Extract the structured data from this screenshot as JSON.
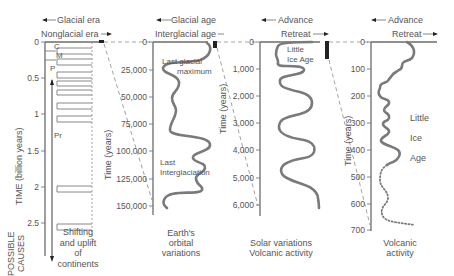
{
  "panels": [
    {
      "id": "era",
      "header_top": "Glacial era",
      "header_bottom": "Nonglacial era",
      "axis_label": "TIME (billion years)",
      "ticks": [
        "0",
        "0.5",
        "1",
        "1.5",
        "2",
        "2.5"
      ],
      "period_labels": [
        "C",
        "M",
        "P",
        "Pr"
      ],
      "cause": [
        "Shifting",
        "and uplift",
        "of",
        "continents"
      ]
    },
    {
      "id": "age",
      "header_top": "Glacial age",
      "header_bottom": "Interglacial age",
      "axis_label": "Time (years)",
      "ticks": [
        "0",
        "25,000",
        "50,000",
        "75,000",
        "100,000",
        "125,000",
        "150,000"
      ],
      "annotations": [
        "Last glacial",
        "maximum",
        "Last",
        "Interglaciation"
      ],
      "cause": [
        "Earth's",
        "orbital",
        "variations"
      ]
    },
    {
      "id": "holocene",
      "header_top": "Advance",
      "header_bottom": "Retreat",
      "axis_label": "Time (years)",
      "ticks": [
        "0",
        "1,000",
        "2,000",
        "3,000",
        "4,000",
        "5,000",
        "6,000"
      ],
      "annotations": [
        "Little",
        "Ice Age"
      ],
      "cause": [
        "Solar variations",
        "Volcanic activity"
      ]
    },
    {
      "id": "recent",
      "header_top": "Advance",
      "header_bottom": "Retreat",
      "axis_label": "Time (years)",
      "ticks": [
        "0",
        "100",
        "200",
        "300",
        "400",
        "500",
        "600",
        "700"
      ],
      "annotations": [
        "Little",
        "Ice",
        "Age"
      ],
      "cause": [
        "Volcanic",
        "activity"
      ]
    }
  ],
  "possible_causes_label": [
    "POSSIBLE",
    "CAUSES"
  ],
  "colors": {
    "curve": "#7a7a7a",
    "axis": "#6b6b6b",
    "text": "#555555",
    "marker": "#222222"
  }
}
